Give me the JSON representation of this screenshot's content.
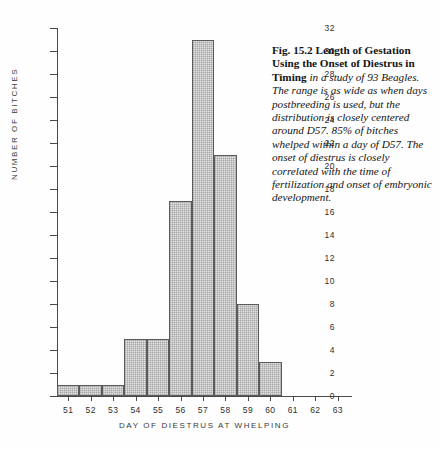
{
  "figure": {
    "caption_lead": "Fig. 15.2 Length of Gestation Using the Onset of Diestrus in Timing",
    "caption_body": " in a study of 93 Beagles. The range is as wide as when days postbreeding is used, but the distribution is closely centered around D57. 85% of bitches whelped within a day of D57. The onset of diestrus is closely correlated with the time of fertilization and onset of embryonic development."
  },
  "chart_data": {
    "type": "bar",
    "title": "",
    "xlabel": "DAY  OF  DIESTRUS  AT  WHELPING",
    "ylabel": "NUMBER  OF  BITCHES",
    "categories": [
      "51",
      "52",
      "53",
      "54",
      "55",
      "56",
      "57",
      "58",
      "59",
      "60",
      "61",
      "62",
      "63"
    ],
    "values": [
      1,
      1,
      1,
      5,
      5,
      17,
      31,
      21,
      8,
      3,
      0,
      0,
      0
    ],
    "xlim": [
      50.5,
      63.5
    ],
    "ylim": [
      0,
      32
    ],
    "ytick_labels": [
      "0",
      "2",
      "4",
      "6",
      "8",
      "10",
      "12",
      "14",
      "16",
      "18",
      "20",
      "22",
      "24",
      "26",
      "28",
      "30",
      "32"
    ],
    "ytick_values": [
      0,
      2,
      4,
      6,
      8,
      10,
      12,
      14,
      16,
      18,
      20,
      22,
      24,
      26,
      28,
      30,
      32
    ],
    "grid": false,
    "legend": false,
    "bar_fill_color": "#e2e2e2",
    "bar_edge_color": "#5a5a5a",
    "axis_color": "#4a4a4a",
    "total_count": 93
  }
}
